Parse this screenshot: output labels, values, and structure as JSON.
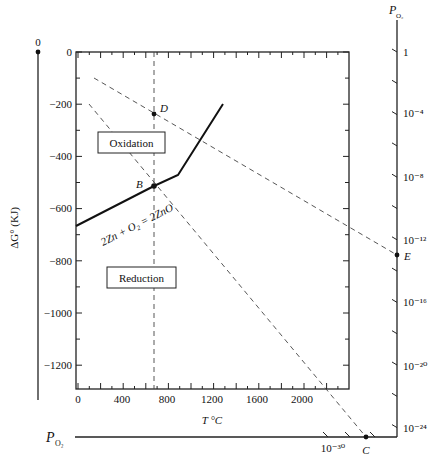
{
  "diagram": {
    "title": "",
    "left_axis": {
      "label": "ΔG° (KJ)",
      "top_value": "0",
      "ticks": [
        "0",
        "−200",
        "−400",
        "−600",
        "−800",
        "−1000",
        "−1200"
      ],
      "tick_values": [
        0,
        -200,
        -400,
        -600,
        -800,
        -1000,
        -1200
      ]
    },
    "bottom_axis": {
      "label": "T °C",
      "ticks": [
        "0",
        "400",
        "800",
        "1200",
        "1600",
        "2000"
      ],
      "tick_values": [
        0,
        400,
        800,
        1200,
        1600,
        2000
      ]
    },
    "right_axis": {
      "label_main": "P",
      "label_sub": "O₂",
      "ticks": [
        "1",
        "10⁻⁴",
        "10⁻⁸",
        "10⁻¹²",
        "10⁻¹⁶",
        "10⁻²⁰",
        "10⁻²⁴"
      ]
    },
    "bottom_po2_axis": {
      "label_main": "P",
      "label_sub": "O₂",
      "tick_label": "10⁻³⁰"
    },
    "regions": {
      "oxidation": "Oxidation",
      "reduction": "Reduction"
    },
    "reaction_label": "2Zn + O₂ = 2ZnO",
    "points": {
      "B": "B",
      "C": "C",
      "D": "D",
      "E": "E"
    }
  },
  "chart_data": {
    "type": "line",
    "xlabel": "T °C",
    "ylabel": "ΔG° (KJ)",
    "xlim": [
      0,
      2400
    ],
    "ylim": [
      -1290,
      0
    ],
    "series": [
      {
        "name": "2Zn + O2 = 2ZnO",
        "style": "solid",
        "x": [
          0,
          700,
          907,
          1300
        ],
        "y": [
          -645,
          -495,
          -450,
          -300
        ]
      },
      {
        "name": "Dashed line T = 700 °C",
        "style": "dashed",
        "x": [
          700,
          700
        ],
        "y": [
          0,
          -1290
        ]
      },
      {
        "name": "Dashed line through D to E (P_O2 = 10^-4 at 700 °C)",
        "style": "dashed",
        "x": [
          150,
          2400
        ],
        "y": [
          -100,
          -700
        ]
      },
      {
        "name": "Dashed line through B to C (equilibrium P_O2)",
        "style": "dashed",
        "x": [
          100,
          2100
        ],
        "y": [
          -200,
          -1290
        ]
      }
    ],
    "annotations": [
      {
        "label": "D",
        "x": 700,
        "y": -230
      },
      {
        "label": "B",
        "x": 700,
        "y": -495
      },
      {
        "label": "E",
        "axis": "right P_O2",
        "value": "≈10^-13"
      },
      {
        "label": "C",
        "axis": "bottom P_O2",
        "value": "<10^-30"
      },
      {
        "label": "Oxidation",
        "region": "above curve"
      },
      {
        "label": "Reduction",
        "region": "below curve"
      }
    ],
    "right_axis_ticks": [
      "1",
      "10^-4",
      "10^-8",
      "10^-12",
      "10^-16",
      "10^-20",
      "10^-24"
    ],
    "bottom_po2_ticks": [
      "10^-30"
    ],
    "grid": false
  }
}
